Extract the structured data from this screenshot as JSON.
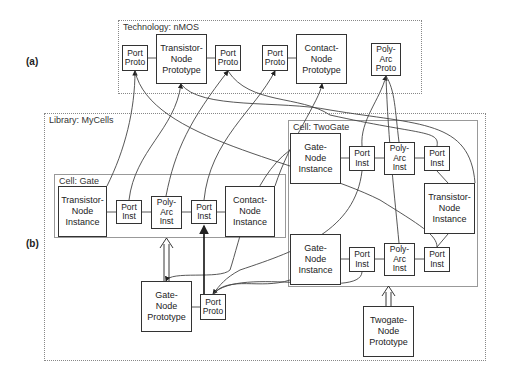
{
  "labels": {
    "a": "(a)",
    "b": "(b)"
  },
  "technology": {
    "title": "Technology: nMOS",
    "items": [
      {
        "name": "port-proto-1",
        "text": "Port\nProto"
      },
      {
        "name": "transistor-node-prototype",
        "text": "Transistor-\nNode\nPrototype"
      },
      {
        "name": "port-proto-2",
        "text": "Port\nProto"
      },
      {
        "name": "port-proto-3",
        "text": "Port\nProto"
      },
      {
        "name": "contact-node-prototype",
        "text": "Contact-\nNode\nPrototype"
      },
      {
        "name": "poly-arc-proto",
        "text": "Poly-\nArc\nProto"
      }
    ]
  },
  "library": {
    "title": "Library: MyCells",
    "cell_gate": {
      "title": "Cell: Gate",
      "items": [
        {
          "name": "transistor-node-instance",
          "text": "Transistor-\nNode\nInstance"
        },
        {
          "name": "port-inst-1",
          "text": "Port\nInst"
        },
        {
          "name": "poly-arc-inst",
          "text": "Poly-\nArc\nInst"
        },
        {
          "name": "port-inst-2",
          "text": "Port\nInst"
        },
        {
          "name": "contact-node-instance",
          "text": "Contact-\nNode\nInstance"
        }
      ]
    },
    "cell_twogate": {
      "title": "Cell: TwoGate",
      "items": [
        {
          "name": "gate-node-instance-1",
          "text": "Gate-\nNode\nInstance"
        },
        {
          "name": "port-inst-a",
          "text": "Port\nInst"
        },
        {
          "name": "poly-arc-inst-1",
          "text": "Poly-\nArc\nInst"
        },
        {
          "name": "port-inst-b",
          "text": "Port\nInst"
        },
        {
          "name": "transistor-node-instance",
          "text": "Transistor-\nNode\nInstance"
        },
        {
          "name": "gate-node-instance-2",
          "text": "Gate-\nNode\nInstance"
        },
        {
          "name": "port-inst-c",
          "text": "Port\nInst"
        },
        {
          "name": "poly-arc-inst-2",
          "text": "Poly-\nArc\nInst"
        },
        {
          "name": "port-inst-d",
          "text": "Port\nInst"
        }
      ]
    },
    "gate_node_prototype": "Gate-\nNode\nPrototype",
    "port_proto": "Port\nProto",
    "twogate_node_prototype": "Twogate-\nNode\nPrototype"
  }
}
